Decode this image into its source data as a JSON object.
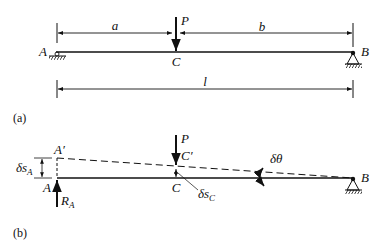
{
  "figure": {
    "panel_a": {
      "caption": "(a)",
      "labels": {
        "A": "A",
        "B": "B",
        "C": "C",
        "P": "P",
        "a": "a",
        "b": "b",
        "l": "l"
      }
    },
    "panel_b": {
      "caption": "(b)",
      "labels": {
        "A": "A",
        "A_prime": "A′",
        "B": "B",
        "C": "C",
        "C_prime": "C′",
        "P": "P",
        "delta_s_A": "δs",
        "delta_s_A_sub": "A",
        "delta_s_C": "δs",
        "delta_s_C_sub": "C",
        "delta_theta": "δθ",
        "R_A": "R",
        "R_A_sub": "A"
      }
    }
  }
}
